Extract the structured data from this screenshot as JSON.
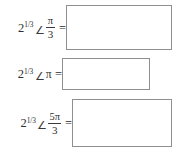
{
  "worksheet": {
    "title": "Polar to rectangular conversion practice",
    "equals_sign": "=",
    "angle_symbol": "∠",
    "pi_symbol": "π",
    "colors": {
      "page_background": "#ffffff",
      "box_border": "#8f8f8f",
      "box_fill": "#ffffff",
      "text": "#2f2f2f"
    },
    "problems": [
      {
        "id": "problem-1",
        "base": "2",
        "exponent": "1/3",
        "angle_symbol": "∠",
        "angle_numerator": "π",
        "angle_denominator": "3",
        "angle_is_fraction": true,
        "equals": "=",
        "answer_value": "",
        "answer_placeholder": ""
      },
      {
        "id": "problem-2",
        "base": "2",
        "exponent": "1/3",
        "angle_symbol": "∠",
        "angle_numerator": "π",
        "angle_denominator": "",
        "angle_is_fraction": false,
        "equals": "=",
        "answer_value": "",
        "answer_placeholder": ""
      },
      {
        "id": "problem-3",
        "base": "2",
        "exponent": "1/3",
        "angle_symbol": "∠",
        "angle_numerator": "5π",
        "angle_denominator": "3",
        "angle_is_fraction": true,
        "equals": "=",
        "answer_value": "",
        "answer_placeholder": ""
      }
    ]
  }
}
